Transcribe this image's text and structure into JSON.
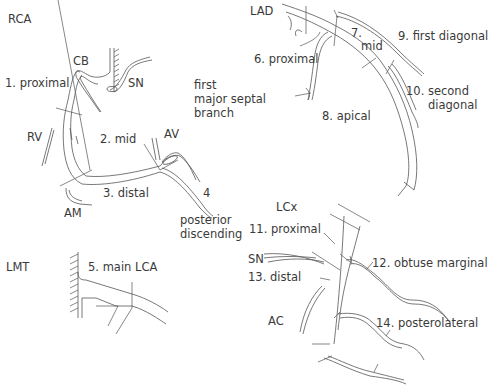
{
  "diagram": {
    "panels": {
      "rca": {
        "title": "RCA",
        "labels": {
          "cb": "CB",
          "sn": "SN",
          "proximal": "1. proximal",
          "rv": "RV",
          "mid": "2. mid",
          "av": "AV",
          "distal": "3. distal",
          "am": "AM",
          "pd_num": "4",
          "pd_line1": "posterior",
          "pd_line2": "discending"
        }
      },
      "lad": {
        "title": "LAD",
        "labels": {
          "proximal": "6. proximal",
          "mid_num": "7.",
          "mid": "mid",
          "first_diagonal": "9. first diagonal",
          "septal_line1": "first",
          "septal_line2": "major septal",
          "septal_line3": "branch",
          "apical": "8. apical",
          "second_diag_line1": "10. second",
          "second_diag_line2": "diagonal"
        }
      },
      "lmt": {
        "title": "LMT",
        "labels": {
          "main": "5. main LCA"
        }
      },
      "lcx": {
        "title": "LCx",
        "labels": {
          "proximal": "11. proximal",
          "sn": "SN",
          "obtuse_marginal": "12. obtuse marginal",
          "distal": "13. distal",
          "ac": "AC",
          "posterolateral": "14. posterolateral"
        }
      }
    },
    "colors": {
      "line": "#555555",
      "text": "#3a3a3a",
      "background": "#ffffff"
    }
  }
}
